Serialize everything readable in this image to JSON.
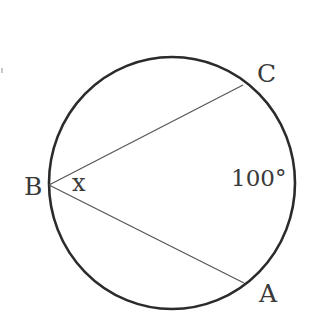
{
  "diagram": {
    "type": "circle-inscribed-angle",
    "circle": {
      "cx": 172,
      "cy": 183,
      "rx": 123,
      "ry": 126,
      "stroke": "#2b2b2b",
      "stroke_width": 2.6
    },
    "points": [
      {
        "id": "B",
        "label": "B",
        "x": 49,
        "y": 185,
        "label_x": 24,
        "label_y": 195
      },
      {
        "id": "C",
        "label": "C",
        "x": 243,
        "y": 85,
        "label_x": 257,
        "label_y": 82
      },
      {
        "id": "A",
        "label": "A",
        "x": 244,
        "y": 283,
        "label_x": 259,
        "label_y": 302
      }
    ],
    "chords": [
      {
        "from": "B",
        "to": "C",
        "stroke": "#555555",
        "stroke_width": 1.2
      },
      {
        "from": "B",
        "to": "A",
        "stroke": "#555555",
        "stroke_width": 1.2
      }
    ],
    "angle": {
      "vertex": "B",
      "label": "x",
      "label_x": 72,
      "label_y": 191
    },
    "arc": {
      "between": [
        "C",
        "A"
      ],
      "label": "100°",
      "label_x": 231,
      "label_y": 186
    },
    "stray_mark": {
      "x": 1,
      "y": 68,
      "w": 2,
      "h": 5,
      "color": "#c8c8c8"
    }
  }
}
